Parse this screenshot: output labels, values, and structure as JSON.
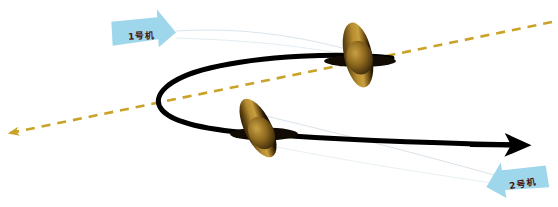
{
  "diagram": {
    "background_color": "#ffffff",
    "width": 558,
    "height": 207
  },
  "labels": [
    {
      "id": "label-1",
      "text": "1号机",
      "banner_color": "#9ed6ec",
      "text_color": "#4a1412",
      "pointer_direction": "right",
      "x": 112,
      "y": 18,
      "width": 62,
      "height": 30
    },
    {
      "id": "label-2",
      "text": "2号机",
      "banner_color": "#9ed6ec",
      "text_color": "#4a1412",
      "pointer_direction": "left",
      "x": 488,
      "y": 166,
      "width": 62,
      "height": 30
    }
  ],
  "aircraft": [
    {
      "id": "aircraft-1",
      "label_ref": "1号机",
      "cx": 358,
      "cy": 55,
      "disc_rx": 13,
      "disc_ry": 33,
      "rotation_deg": -12,
      "body_color": "#1a1008",
      "prop_color_light": "#c59b3e",
      "prop_color_dark": "#2b1c08"
    },
    {
      "id": "aircraft-2",
      "label_ref": "2号机",
      "cx": 258,
      "cy": 128,
      "disc_rx": 13,
      "disc_ry": 32,
      "rotation_deg": -26,
      "body_color": "#1a1008",
      "prop_color_light": "#c59b3e",
      "prop_color_dark": "#2b1c08"
    }
  ],
  "trajectory": {
    "name": "flight-path",
    "color": "#000000",
    "stroke_width": 5,
    "style": "solid",
    "has_arrowhead": true,
    "arrow_end": [
      537,
      145
    ],
    "shape": "loop",
    "description": "黑色实线航迹，自右上方向左盘旋一周后向右飞出"
  },
  "axis": {
    "name": "reference-axis",
    "color": "#c9a227",
    "stroke_width": 2.6,
    "style": "dashed",
    "dash_pattern": "9 7",
    "has_arrowhead": true,
    "arrow_end": [
      8,
      133
    ],
    "start": [
      552,
      22
    ],
    "description": "橙黄色虚线基准轴线"
  },
  "leaders": [
    {
      "name": "leader-line-1",
      "color": "#d3dde4",
      "from": [
        176,
        32
      ],
      "to": [
        352,
        52
      ]
    },
    {
      "name": "leader-line-2",
      "color": "#d3dde4",
      "from": [
        268,
        118
      ],
      "to": [
        500,
        178
      ]
    }
  ]
}
